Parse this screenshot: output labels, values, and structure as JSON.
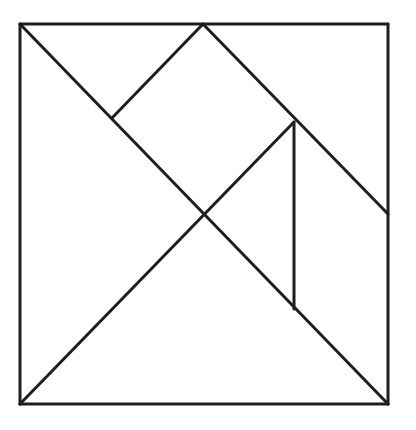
{
  "diagram": {
    "type": "tangram-square",
    "stroke_color": "#1e1e1e",
    "background_color": "#ffffff",
    "outline": {
      "x1": 20,
      "y1": 24,
      "x2": 388,
      "y2": 404
    },
    "vertices": {
      "top_left": [
        20,
        24
      ],
      "top_mid": [
        203,
        24
      ],
      "top_right": [
        388,
        24
      ],
      "left_notch": [
        112,
        118
      ],
      "inner_right": [
        294,
        122
      ],
      "center": [
        204,
        214
      ],
      "right_mid": [
        388,
        214
      ],
      "vertical_foot": [
        294,
        309
      ],
      "bottom_left": [
        20,
        404
      ],
      "bottom_right": [
        388,
        404
      ]
    },
    "pieces": [
      {
        "name": "large-triangle-left",
        "points": "20,24 204,214 20,404"
      },
      {
        "name": "large-triangle-bottom",
        "points": "20,404 204,214 388,404"
      },
      {
        "name": "small-triangle-top",
        "points": "20,24 203,24 112,118"
      },
      {
        "name": "square",
        "points": "203,24 294,122 204,214 112,118"
      },
      {
        "name": "medium-triangle-top-right",
        "points": "203,24 388,24 388,214"
      },
      {
        "name": "small-triangle-center",
        "points": "204,214 294,122 294,309"
      },
      {
        "name": "parallelogram-right",
        "points": "294,122 388,214 388,404 294,309"
      }
    ],
    "lines": [
      {
        "name": "outline-top",
        "x1": 20,
        "y1": 24,
        "x2": 388,
        "y2": 24
      },
      {
        "name": "outline-right",
        "x1": 388,
        "y1": 24,
        "x2": 388,
        "y2": 404
      },
      {
        "name": "outline-bottom",
        "x1": 388,
        "y1": 404,
        "x2": 20,
        "y2": 404
      },
      {
        "name": "outline-left",
        "x1": 20,
        "y1": 404,
        "x2": 20,
        "y2": 24
      },
      {
        "name": "main-diagonal",
        "x1": 20,
        "y1": 24,
        "x2": 388,
        "y2": 404
      },
      {
        "name": "anti-diagonal-lower",
        "x1": 20,
        "y1": 404,
        "x2": 294,
        "y2": 122
      },
      {
        "name": "top-mid-to-right-mid",
        "x1": 203,
        "y1": 24,
        "x2": 388,
        "y2": 214
      },
      {
        "name": "top-mid-to-left-notch",
        "x1": 203,
        "y1": 24,
        "x2": 112,
        "y2": 118
      },
      {
        "name": "inner-vertical",
        "x1": 294,
        "y1": 122,
        "x2": 294,
        "y2": 309
      }
    ]
  }
}
